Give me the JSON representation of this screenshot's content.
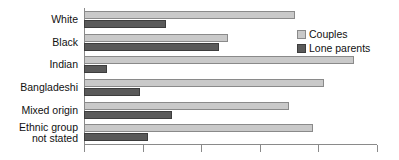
{
  "chart_data": {
    "type": "bar",
    "orientation": "horizontal",
    "title": "",
    "xlabel": "",
    "ylabel": "",
    "grid": false,
    "legend_position": "top-right",
    "xlim": [
      0,
      100
    ],
    "xticks": [
      0,
      20,
      40,
      60,
      80,
      100
    ],
    "xticklabels": [
      "",
      "",
      "",
      "",
      "",
      ""
    ],
    "categories": [
      "White",
      "Black",
      "Indian",
      "Bangladeshi",
      "Mixed origin",
      "Ethnic group\nnot stated"
    ],
    "series": [
      {
        "name": "Couples",
        "color": "#c9c9c9",
        "values": [
          72,
          49,
          92,
          82,
          70,
          78
        ]
      },
      {
        "name": "Lone parents",
        "color": "#5a5a5a",
        "values": [
          28,
          46,
          8,
          19,
          30,
          22
        ]
      }
    ]
  },
  "legend": {
    "items": [
      {
        "label": "Couples",
        "swatch": "couples"
      },
      {
        "label": "Lone parents",
        "swatch": "lone"
      }
    ]
  },
  "colors": {
    "couples": "#c9c9c9",
    "lone_parents": "#5a5a5a",
    "axis": "#8a8a8a",
    "text": "#111111",
    "background": "#ffffff"
  }
}
